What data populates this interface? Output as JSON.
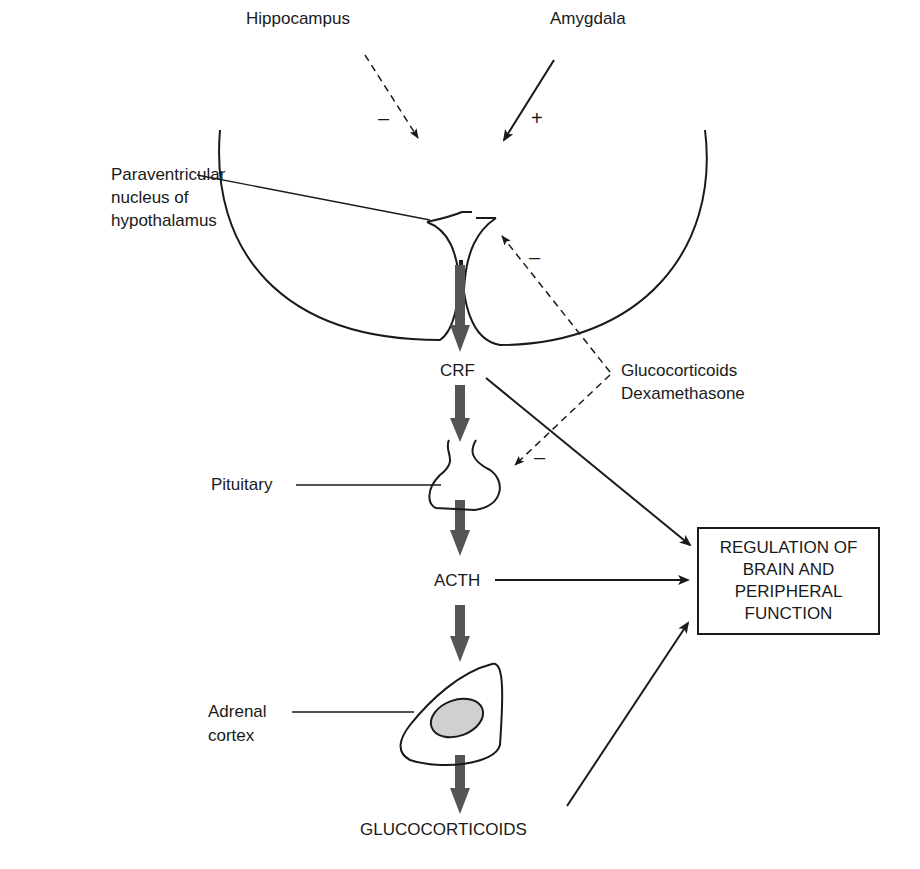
{
  "diagram": {
    "inputs": {
      "hippocampus": {
        "label": "Hippocampus",
        "sign": "–",
        "style": "dashed"
      },
      "amygdala": {
        "label": "Amygdala",
        "sign": "+",
        "style": "solid"
      }
    },
    "structures": {
      "pvn": {
        "label_line1": "Paraventricular",
        "label_line2": "nucleus of",
        "label_line3": "hypothalamus"
      },
      "pituitary": {
        "label": "Pituitary"
      },
      "adrenal": {
        "label_line1": "Adrenal",
        "label_line2": "cortex"
      }
    },
    "hormones": {
      "crf": "CRF",
      "acth": "ACTH",
      "glucocorticoids": "GLUCOCORTICOIDS"
    },
    "feedback": {
      "label_line1": "Glucocorticoids",
      "label_line2": "Dexamethasone",
      "sign_pvn": "–",
      "sign_pituitary": "–"
    },
    "target_box": {
      "line1": "REGULATION OF",
      "line2": "BRAIN AND",
      "line3": "PERIPHERAL",
      "line4": "FUNCTION"
    },
    "colors": {
      "ink": "#1a1a1a",
      "flow_arrow": "#555555",
      "adrenal_fill": "#d0d0d0"
    }
  }
}
